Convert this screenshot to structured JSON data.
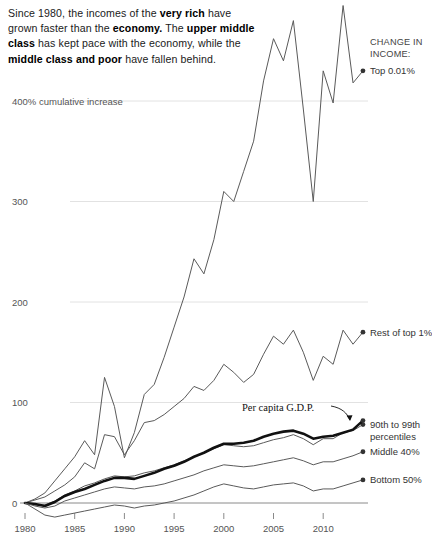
{
  "headline": {
    "segments": [
      {
        "text": "Since 1980, the incomes of the ",
        "bold": false
      },
      {
        "text": "very rich",
        "bold": true
      },
      {
        "text": " have grown faster than the ",
        "bold": false
      },
      {
        "text": "economy.",
        "bold": true
      },
      {
        "text": " The ",
        "bold": false
      },
      {
        "text": "upper middle class",
        "bold": true
      },
      {
        "text": " has kept pace with the economy, while the ",
        "bold": false
      },
      {
        "text": "middle class and poor",
        "bold": true
      },
      {
        "text": " have fallen behind.",
        "bold": false
      }
    ]
  },
  "kicker": {
    "line1": "CHANGE IN",
    "line2": "INCOME:"
  },
  "annotation": {
    "per_capita_gdp": "Per capita G.D.P."
  },
  "chart_data": {
    "type": "line",
    "title": "",
    "xlabel": "",
    "ylabel": "400% cumulative increase",
    "ylim": [
      -20,
      500
    ],
    "xlim": [
      1980,
      2014
    ],
    "grid": true,
    "legend_position": "right-end-labels",
    "yticks": [
      0,
      100,
      200,
      300,
      400
    ],
    "ytick_labels": [
      "0",
      "100",
      "200",
      "300",
      "400% cumulative increase"
    ],
    "xticks": [
      1980,
      1985,
      1990,
      1995,
      2000,
      2005,
      2010
    ],
    "xtick_labels": [
      "1980",
      "1985",
      "1990",
      "1995",
      "2000",
      "2005",
      "2010"
    ],
    "x": [
      1980,
      1981,
      1982,
      1983,
      1984,
      1985,
      1986,
      1987,
      1988,
      1989,
      1990,
      1991,
      1992,
      1993,
      1994,
      1995,
      1996,
      1997,
      1998,
      1999,
      2000,
      2001,
      2002,
      2003,
      2004,
      2005,
      2006,
      2007,
      2008,
      2009,
      2010,
      2011,
      2012,
      2013,
      2014
    ],
    "series": [
      {
        "name": "Top 0.01%",
        "label": "Top 0.01%",
        "emphasis": false,
        "color": "#5a5a5a",
        "values": [
          0,
          4,
          10,
          22,
          34,
          46,
          62,
          48,
          125,
          96,
          45,
          70,
          108,
          118,
          145,
          175,
          205,
          243,
          228,
          262,
          310,
          300,
          330,
          360,
          420,
          462,
          440,
          480,
          392,
          300,
          430,
          398,
          495,
          418,
          430
        ]
      },
      {
        "name": "Rest of top 1%",
        "label": "Rest of top 1%",
        "emphasis": false,
        "color": "#5a5a5a",
        "values": [
          0,
          3,
          6,
          12,
          18,
          26,
          40,
          34,
          68,
          66,
          48,
          62,
          80,
          82,
          88,
          96,
          104,
          116,
          112,
          122,
          138,
          130,
          120,
          128,
          148,
          166,
          158,
          172,
          150,
          122,
          146,
          138,
          172,
          158,
          170
        ]
      },
      {
        "name": "90th to 99th percentiles",
        "label": "90th to 99th\npercentiles",
        "emphasis": false,
        "color": "#5a5a5a",
        "values": [
          0,
          -2,
          -2,
          2,
          8,
          12,
          17,
          20,
          24,
          27,
          26,
          27,
          30,
          32,
          35,
          38,
          42,
          46,
          50,
          54,
          58,
          57,
          56,
          57,
          60,
          63,
          65,
          68,
          64,
          58,
          64,
          64,
          70,
          72,
          78
        ]
      },
      {
        "name": "Per capita G.D.P.",
        "label": "Per capita G.D.P.",
        "emphasis": true,
        "color": "#111111",
        "values": [
          0,
          -1,
          -3,
          1,
          7,
          11,
          14,
          18,
          22,
          25,
          25,
          24,
          27,
          30,
          34,
          37,
          41,
          46,
          50,
          55,
          59,
          59,
          60,
          62,
          66,
          69,
          71,
          72,
          69,
          64,
          66,
          67,
          70,
          73,
          82
        ]
      },
      {
        "name": "Middle 40%",
        "label": "Middle 40%",
        "emphasis": false,
        "color": "#5a5a5a",
        "values": [
          0,
          -3,
          -5,
          -3,
          2,
          5,
          8,
          11,
          14,
          16,
          15,
          14,
          16,
          17,
          19,
          22,
          25,
          28,
          32,
          35,
          38,
          37,
          36,
          37,
          39,
          41,
          43,
          45,
          42,
          38,
          41,
          41,
          44,
          47,
          51
        ]
      },
      {
        "name": "Bottom 50%",
        "label": "Bottom 50%",
        "emphasis": false,
        "color": "#5a5a5a",
        "values": [
          0,
          -6,
          -12,
          -14,
          -12,
          -10,
          -8,
          -6,
          -4,
          -2,
          -3,
          -5,
          -3,
          -2,
          0,
          2,
          5,
          8,
          12,
          16,
          19,
          17,
          15,
          14,
          16,
          18,
          19,
          20,
          17,
          12,
          14,
          14,
          17,
          20,
          23
        ]
      }
    ]
  }
}
